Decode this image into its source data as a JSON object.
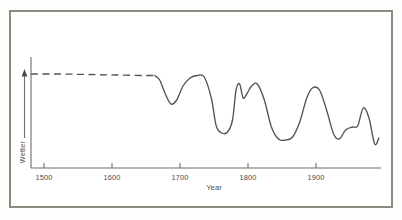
{
  "figure": {
    "frame_color": "#8d8a80",
    "background": "#ffffff",
    "curve_color": "#55534e",
    "axis_color": "#6f6d67"
  },
  "chart_data": {
    "type": "line",
    "title": "",
    "subtitle": "",
    "xlabel": "Year",
    "ylabel": "Wetter",
    "ylabel_arrow": "up-arrow",
    "xlim": [
      1480,
      1975
    ],
    "ylim": [
      0,
      1
    ],
    "grid": false,
    "legend": null,
    "axis_ticks": {
      "x": [
        1500,
        1600,
        1700,
        1800,
        1900
      ],
      "x_labels": [
        "1500",
        "1600",
        "1700",
        "1800",
        "1900"
      ],
      "y": [],
      "y_labels": []
    },
    "series": [
      {
        "name": "Wetter (reconstructed, uncertain)",
        "style": "dashed",
        "x": [
          1480,
          1520,
          1560,
          1600,
          1640,
          1655
        ],
        "values": [
          0.86,
          0.86,
          0.855,
          0.85,
          0.845,
          0.845
        ]
      },
      {
        "name": "Wetter (measured)",
        "style": "solid",
        "x": [
          1655,
          1662,
          1670,
          1678,
          1686,
          1695,
          1705,
          1715,
          1725,
          1735,
          1742,
          1750,
          1758,
          1765,
          1770,
          1775,
          1780,
          1785,
          1792,
          1800,
          1810,
          1820,
          1830,
          1840,
          1850,
          1860,
          1870,
          1878,
          1888,
          1898,
          1908,
          1916,
          1925,
          1935,
          1942,
          1950,
          1958,
          1966,
          1972
        ],
        "values": [
          0.845,
          0.8,
          0.66,
          0.56,
          0.6,
          0.74,
          0.82,
          0.845,
          0.83,
          0.62,
          0.34,
          0.27,
          0.28,
          0.4,
          0.7,
          0.76,
          0.62,
          0.66,
          0.74,
          0.76,
          0.6,
          0.33,
          0.21,
          0.2,
          0.23,
          0.38,
          0.62,
          0.72,
          0.7,
          0.5,
          0.26,
          0.21,
          0.3,
          0.33,
          0.34,
          0.52,
          0.42,
          0.16,
          0.22
        ]
      }
    ],
    "annotations": [
      {
        "text": "dashed segment indicates estimated/pre-instrumental data",
        "range": [
          1480,
          1655
        ]
      }
    ]
  },
  "axis": {
    "x_label": "Year",
    "y_label": "Wetter",
    "tick_labels": [
      "1500",
      "1600",
      "1700",
      "1800",
      "1900"
    ]
  }
}
